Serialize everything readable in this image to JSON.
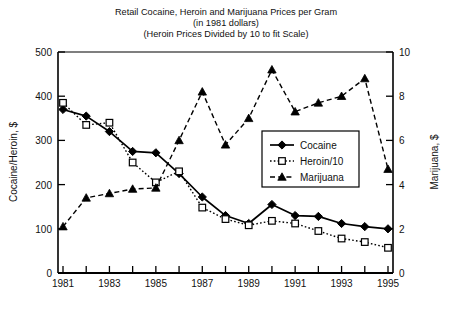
{
  "chart_data": {
    "type": "line",
    "title": "Retail Cocaine, Heroin and Marijuana Prices per Gram",
    "subtitle": "(in 1981 dollars)",
    "subtitle2": "(Heroin Prices Divided by 10 to fit Scale)",
    "xlabel": "",
    "ylabel": "Cocaine/Heroin, $",
    "ylabel_right": "Marijuana, $",
    "xlim": [
      1981,
      1995
    ],
    "ylim": [
      0,
      500
    ],
    "ylim_right": [
      0,
      10
    ],
    "yticks": [
      0,
      100,
      200,
      300,
      400,
      500
    ],
    "yticks_right": [
      0,
      2,
      4,
      6,
      8,
      10
    ],
    "x": [
      1981,
      1982,
      1983,
      1984,
      1985,
      1986,
      1987,
      1988,
      1989,
      1990,
      1991,
      1992,
      1993,
      1994,
      1995
    ],
    "xticks_labeled": [
      1981,
      1983,
      1985,
      1987,
      1989,
      1991,
      1993,
      1995
    ],
    "grid": false,
    "legend_position": "center-right",
    "series": [
      {
        "name": "Cocaine",
        "axis": "left",
        "marker": "filled-diamond",
        "line": "solid",
        "values": [
          370,
          355,
          320,
          275,
          272,
          225,
          172,
          130,
          112,
          155,
          130,
          128,
          112,
          105,
          100
        ]
      },
      {
        "name": "Heroin/10",
        "axis": "left",
        "marker": "open-square",
        "line": "dotted",
        "values": [
          385,
          335,
          340,
          250,
          205,
          230,
          148,
          122,
          108,
          118,
          112,
          95,
          78,
          70,
          57
        ]
      },
      {
        "name": "Marijuana",
        "axis": "right",
        "marker": "filled-triangle",
        "line": "dashed",
        "values": [
          2.1,
          3.4,
          3.6,
          3.8,
          3.85,
          6.0,
          8.2,
          5.8,
          7.0,
          9.2,
          7.3,
          7.7,
          8.0,
          8.8,
          4.7
        ]
      }
    ]
  },
  "legend": {
    "items": [
      {
        "label": "Cocaine"
      },
      {
        "label": "Heroin/10"
      },
      {
        "label": "Marijuana"
      }
    ]
  },
  "colors": {
    "axis": "#000000",
    "series": "#000000",
    "background": "#ffffff"
  }
}
